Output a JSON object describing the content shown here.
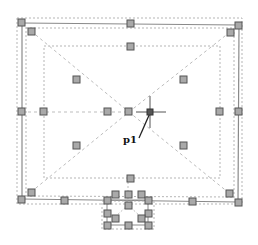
{
  "diagram": {
    "type": "cad-drawing-selection",
    "label_p1": "p1",
    "colors": {
      "background": "#ffffff",
      "solid_line": "#8a8a8a",
      "dashed_line": "#b5b5b5",
      "grip_fill": "#a9a9a9",
      "grip_stroke": "#555555",
      "crosshair": "#555555",
      "leader": "#222222"
    }
  }
}
